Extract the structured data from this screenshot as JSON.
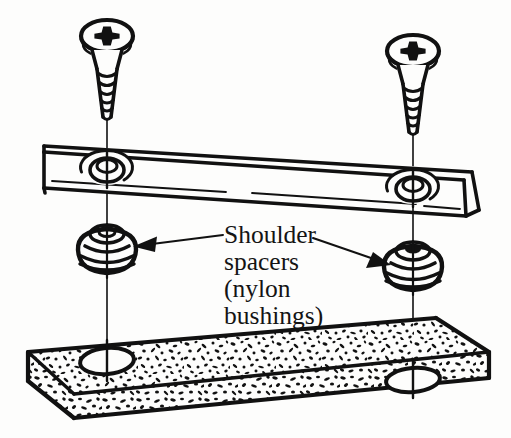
{
  "figure": {
    "background_color": "#fdfdfc",
    "ink_color": "#111111",
    "width": 511,
    "height": 438
  },
  "callout": {
    "lines": [
      "Shoulder",
      "spacers",
      "(nylon",
      "bushings)"
    ],
    "line1": "Shoulder",
    "line2": "spacers",
    "line3": "(nylon",
    "line4": "bushings)",
    "font_size_px": 25.5,
    "text_color": "#141414"
  },
  "parts": {
    "screws": [
      {
        "name": "left-phillips-screw",
        "head_type": "pan-head",
        "drive": "phillips-cross",
        "thread_rings": 5
      },
      {
        "name": "right-phillips-screw",
        "head_type": "pan-head",
        "drive": "phillips-cross",
        "thread_rings": 5
      }
    ],
    "bracket": {
      "name": "metal-mounting-bracket",
      "hole_count": 2,
      "hole_type": "countersunk"
    },
    "spacers": [
      {
        "name": "left-shoulder-spacer",
        "material": "nylon"
      },
      {
        "name": "right-shoulder-spacer",
        "material": "nylon"
      }
    ],
    "base": {
      "name": "particleboard-base",
      "material": "particleboard",
      "hole_count": 2
    }
  },
  "annotations": {
    "left_arrow": {
      "name": "left-callout-arrow",
      "direction": "left"
    },
    "right_arrow": {
      "name": "right-callout-arrow",
      "direction": "down-right"
    }
  }
}
